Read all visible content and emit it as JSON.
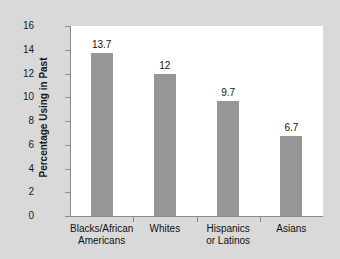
{
  "chart_data": {
    "type": "bar",
    "title": "",
    "subtitle": "",
    "xlabel": "",
    "ylabel": "Percentage Using in Past",
    "categories": [
      "Blacks/African Americans",
      "Whites",
      "Hispanics or Latinos",
      "Asians"
    ],
    "category_lines": [
      [
        "Blacks/African",
        "Americans"
      ],
      [
        "Whites"
      ],
      [
        "Hispanics",
        "or Latinos"
      ],
      [
        "Asians"
      ]
    ],
    "values": [
      13.7,
      12,
      9.7,
      6.7
    ],
    "value_labels": [
      "13.7",
      "12",
      "9.7",
      "6.7"
    ],
    "ylim": [
      0,
      16
    ],
    "ytick_step": 2,
    "yticks": [
      "16",
      "14",
      "12",
      "10",
      "8",
      "6",
      "4",
      "2",
      "0"
    ],
    "ytick_values": [
      16,
      14,
      12,
      10,
      8,
      6,
      4,
      2,
      0
    ],
    "grid": false,
    "legend": false,
    "legend_position": "none",
    "bar_color": "#969696",
    "plot_background": "#ffffff",
    "figure_background": "#d9d9d9",
    "axis_color": "#8c8c8c",
    "text_color": "#111111"
  }
}
